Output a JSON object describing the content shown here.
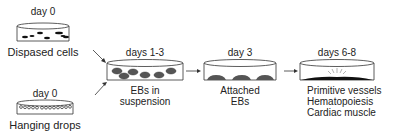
{
  "stages": [
    {
      "id": "dispersed",
      "day": "day 0",
      "label": "Dispased cells"
    },
    {
      "id": "hanging",
      "day": "day 0",
      "label": "Hanging drops"
    },
    {
      "id": "suspension",
      "day": "days 1-3",
      "label_lines": [
        "EBs in",
        "suspension"
      ]
    },
    {
      "id": "attached",
      "day": "day 3",
      "label_lines": [
        "Attached",
        "EBs"
      ]
    },
    {
      "id": "differentiated",
      "day": "days 6-8",
      "label_lines": [
        "Primitive vessels",
        "Hematopoiesis",
        "Cardiac muscle"
      ]
    }
  ],
  "colors": {
    "stroke": "#333333",
    "fill_dark": "#555555",
    "cell_black": "#111111"
  }
}
